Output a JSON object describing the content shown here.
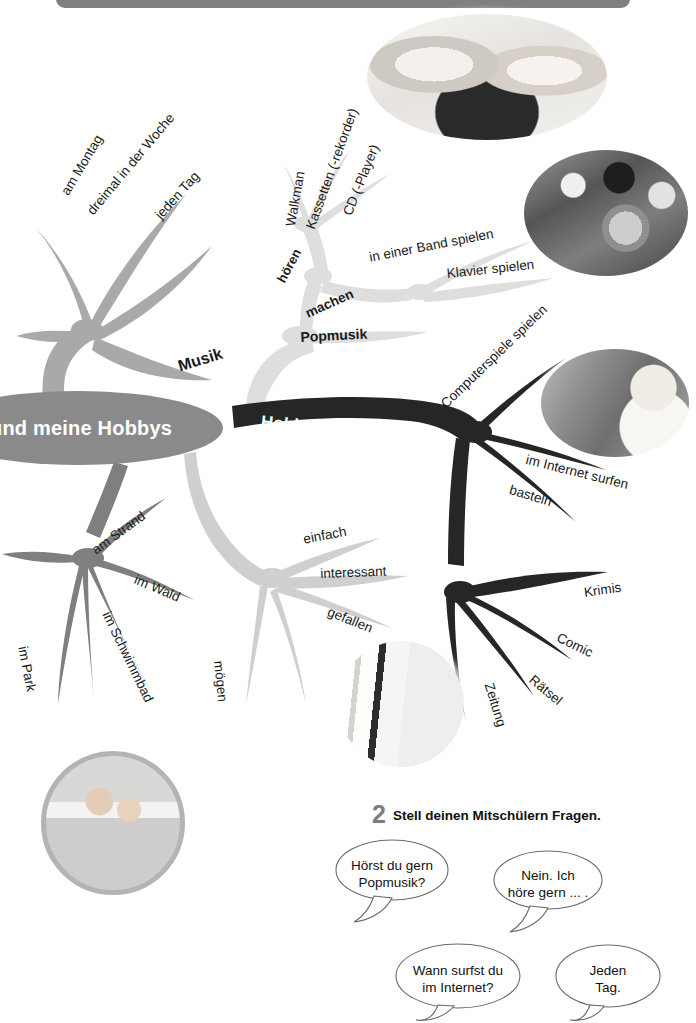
{
  "page": {
    "top_bar": {
      "name": "page-header-bar",
      "color": "#808080"
    },
    "background": "#ffffff"
  },
  "mindmap": {
    "center_node": {
      "label": "und meine Hobbys",
      "color": "#8a8a8a",
      "text_color": "#ffffff"
    },
    "branches": [
      {
        "id": "wann",
        "label": "Wann?",
        "color": "#a8a8a8",
        "text_color": "#ffffff",
        "leaves": [
          "am Montag",
          "dreimal in der Woche",
          "jeden Tag"
        ]
      },
      {
        "id": "musik",
        "label": "Musik",
        "color": "#d9d9d9",
        "text_color": "#111111",
        "leaves": [
          "Popmusik"
        ],
        "sub_branches": [
          {
            "id": "hoeren",
            "label": "hören",
            "leaves": [
              "Walkman",
              "Kassetten (-rekorder)",
              "CD (-Player)"
            ]
          },
          {
            "id": "machen",
            "label": "machen",
            "leaves": [
              "in einer Band spielen",
              "Klavier spielen"
            ]
          }
        ]
      },
      {
        "id": "hobbys-zu-hause",
        "label": "Hobbys zu Hause",
        "color": "#2b2b2b",
        "text_color": "#ffffff",
        "leaves": [
          "Computerspiele spielen",
          "im Internet surfen",
          "basteln"
        ],
        "sub_branches": [
          {
            "id": "lesen",
            "label": "lesen",
            "leaves": [
              "Krimis",
              "Comic",
              "Rätsel",
              "Zeitung"
            ]
          }
        ]
      },
      {
        "id": "wo",
        "label": "Wo?",
        "color": "#7d7d7d",
        "text_color": "#ffffff",
        "leaves": [
          "am Strand",
          "im Wald",
          "im Schwimmbad",
          "im Park"
        ]
      },
      {
        "id": "wie-ist-das",
        "label": "Wie ist das?",
        "color": "#cfcfcf",
        "text_color": "#ffffff",
        "leaves": [
          "einfach",
          "interessant",
          "gefallen",
          "mögen"
        ]
      }
    ],
    "photos": [
      {
        "id": "girls-listening-music-photo",
        "alt": "zwei Mädchen hören Musik"
      },
      {
        "id": "band-playing-photo",
        "alt": "Band spielt"
      },
      {
        "id": "boy-at-computer-photo",
        "alt": "Junge am Computer"
      },
      {
        "id": "newspaper-glasses-photo",
        "alt": "Zeitung und Brille"
      },
      {
        "id": "children-at-beach-photo",
        "alt": "Kinder am Strand"
      }
    ]
  },
  "exercise": {
    "number": "2",
    "title": "Stell deinen Mitschülern Fragen.",
    "bubbles": [
      {
        "id": "bubble-question-1",
        "lines": [
          "Hörst du gern",
          "Popmusik?"
        ]
      },
      {
        "id": "bubble-answer-1",
        "lines": [
          "Nein. Ich",
          "höre gern ... ."
        ]
      },
      {
        "id": "bubble-question-2",
        "lines": [
          "Wann surfst du",
          "im Internet?"
        ]
      },
      {
        "id": "bubble-answer-2",
        "lines": [
          "Jeden",
          "Tag."
        ]
      }
    ]
  }
}
